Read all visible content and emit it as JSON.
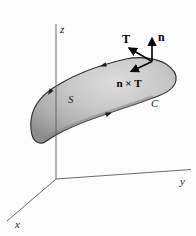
{
  "figure": {
    "axis_labels": {
      "x": "x",
      "y": "y",
      "z": "z"
    },
    "surface_label": "S",
    "curve_label": "C",
    "vector_labels": {
      "normal": "n",
      "tangent": "T",
      "normal_cross_tangent": "n × T"
    },
    "colors": {
      "background": "#fdfdfd",
      "surface_fill_light": "#d9d9d9",
      "surface_fill_dark": "#8e8e8e",
      "surface_outline": "#2f2f2f",
      "axis_line": "#5a5a5a",
      "vector_arrow": "#0a0a0a"
    }
  }
}
